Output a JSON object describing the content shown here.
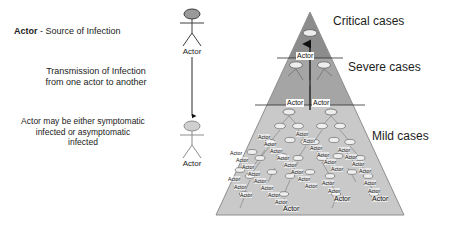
{
  "diagram": {
    "legend": {
      "line1_bold": "Actor",
      "line1_rest": " - Source of Infection",
      "line2": "Transmission of Infection\nfrom one actor to another",
      "line2_a": "Transmission of Infection",
      "line2_b": "from one actor to another",
      "line3_a": "Actor may be either symptomatic",
      "line3_b": "infected or asymptomatic",
      "line3_c": "infected",
      "actor_top_label": "Actor",
      "actor_bottom_label": "Actor"
    },
    "pyramid": {
      "bands": [
        {
          "name": "critical",
          "label": "Critical cases",
          "color": "#8c8c8c"
        },
        {
          "name": "severe",
          "label": "Severe cases",
          "color": "#a5a5a5"
        },
        {
          "name": "mild",
          "label": "Mild cases",
          "color": "#c9c9c9"
        }
      ],
      "apex_actor_label": "Actor",
      "severe_actor_labels": [
        "Actor",
        "Actor"
      ],
      "node_label": "Actor",
      "outline_color": "#8e8e8e"
    },
    "colors": {
      "text": "#1a1a1a",
      "actor_dark": "#3a3a3a",
      "actor_light": "#9b9b9b",
      "band_critical": "#8c8c8c",
      "band_severe": "#a5a5a5",
      "band_mild": "#c9c9c9"
    }
  }
}
